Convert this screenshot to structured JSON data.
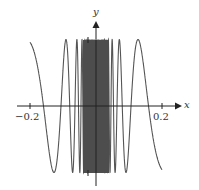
{
  "chart_data": {
    "type": "line",
    "title": "",
    "function": "y = sin(1/x)",
    "xlabel": "x",
    "ylabel": "y",
    "xlim": [
      -0.2,
      0.2
    ],
    "ylim": [
      -1,
      1
    ],
    "x_ticks": [
      "-0.2",
      "0.2"
    ],
    "y_ticks": [
      "1",
      "-1"
    ],
    "grid": false,
    "legend": "none",
    "series": [
      {
        "name": "sin(1/x)",
        "x_range": [
          -0.2,
          0.2
        ],
        "color": "#555555"
      }
    ]
  },
  "labels": {
    "x_axis": "x",
    "y_axis": "y",
    "x_tick_neg": "−0.2",
    "x_tick_pos": "0.2"
  },
  "colors": {
    "curve": "#555555",
    "axis": "#222222"
  }
}
